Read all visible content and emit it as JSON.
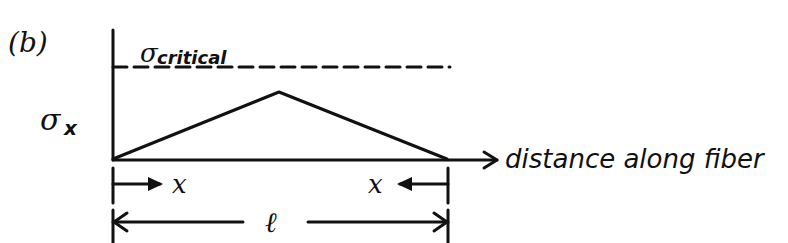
{
  "panel_label": "(b)",
  "y_axis_label": {
    "symbol": "σ",
    "subscript": "x"
  },
  "threshold_label": {
    "symbol": "σ",
    "subscript": "critical"
  },
  "x_axis_label": "distance along fiber",
  "dimension_labels": {
    "left_transfer_length": "x",
    "right_transfer_length": "x",
    "fiber_length": "ℓ"
  },
  "profile": {
    "shape": "triangle",
    "description": "Stress rises linearly from zero at fiber ends to a peak at mid-length, remaining below critical stress",
    "peak_below_critical": true
  },
  "colors": {
    "ink": "#111111",
    "background": "#ffffff"
  }
}
